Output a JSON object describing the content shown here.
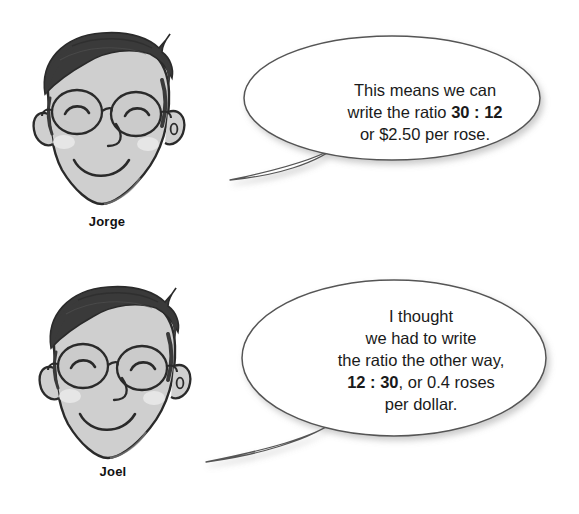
{
  "illustration": {
    "type": "two-panel cartoon dialogue about ratios",
    "background_color": "#ffffff"
  },
  "panels": [
    {
      "character": {
        "name_label": "Jorge",
        "icon": "cartoon-face-with-glasses-icon",
        "skin_color": "#cfcfcf",
        "hair_color": "#3a3a3a",
        "cheek_color": "#e4e4e4"
      },
      "speech_bubble": {
        "icon": "speech-bubble-icon",
        "outline_color": "#555555",
        "fill_color": "#ffffff",
        "lines": [
          {
            "plain_before": "This means we can",
            "bold": "",
            "plain_after": ""
          },
          {
            "plain_before": "write the ratio ",
            "bold": "30 : 12",
            "plain_after": ""
          },
          {
            "plain_before": "or $2.50 per rose.",
            "bold": "",
            "plain_after": ""
          }
        ],
        "full_text": "This means we can write the ratio 30 : 12 or $2.50 per rose."
      }
    },
    {
      "character": {
        "name_label": "Joel",
        "icon": "cartoon-face-with-glasses-icon",
        "skin_color": "#cfcfcf",
        "hair_color": "#3a3a3a",
        "cheek_color": "#e4e4e4"
      },
      "speech_bubble": {
        "icon": "speech-bubble-icon",
        "outline_color": "#555555",
        "fill_color": "#ffffff",
        "lines": [
          {
            "plain_before": "I thought",
            "bold": "",
            "plain_after": ""
          },
          {
            "plain_before": "we had to write",
            "bold": "",
            "plain_after": ""
          },
          {
            "plain_before": "the ratio the other way,",
            "bold": "",
            "plain_after": ""
          },
          {
            "plain_before": "",
            "bold": "12 : 30",
            "plain_after": ", or 0.4 roses"
          },
          {
            "plain_before": "per dollar.",
            "bold": "",
            "plain_after": ""
          }
        ],
        "full_text": "I thought we had to write the ratio the other way, 12 : 30, or 0.4 roses per dollar."
      }
    }
  ]
}
